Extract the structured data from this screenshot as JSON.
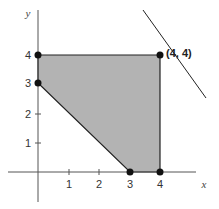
{
  "diagram": {
    "axes": {
      "x_label": "x",
      "y_label": "y",
      "x_ticks": [
        "1",
        "2",
        "3",
        "4"
      ],
      "y_ticks": [
        "1",
        "2",
        "3",
        "4"
      ]
    },
    "feasible_region": {
      "vertices": [
        [
          0,
          4
        ],
        [
          4,
          4
        ],
        [
          4,
          0
        ],
        [
          3,
          0
        ],
        [
          0,
          3
        ]
      ],
      "fill_color": "#b3b3b3",
      "edge_color": "#222222"
    },
    "vertex_points": [
      [
        0,
        4
      ],
      [
        0,
        3
      ],
      [
        4,
        4
      ],
      [
        4,
        0
      ],
      [
        3,
        0
      ]
    ],
    "highlight_point": {
      "label": "(4, 4)",
      "coords": [
        4,
        4
      ]
    },
    "objective_line": {
      "description": "line tangent at (4, 4) with slope -1 (x + y = 8)"
    },
    "colors": {
      "axis": "#555555",
      "region": "#b3b3b3",
      "point": "#111111",
      "background": "#ffffff"
    }
  }
}
